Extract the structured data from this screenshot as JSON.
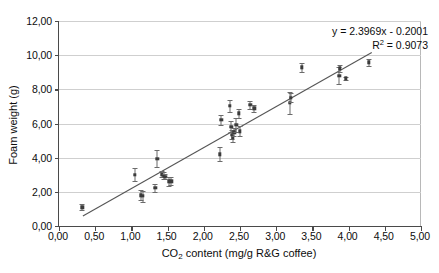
{
  "chart_data": {
    "type": "scatter",
    "title": "",
    "xlabel": "CO2 content (mg/g R&G coffee)",
    "xlabel_main": "CO",
    "xlabel_sub": "2",
    "xlabel_rest": " content (mg/g R&G coffee)",
    "ylabel": "Foam weight (g)",
    "xlim": [
      0,
      5
    ],
    "ylim": [
      0,
      12
    ],
    "x_ticks": [
      "0,00",
      "0,50",
      "1,00",
      "1,50",
      "2,00",
      "2,50",
      "3,00",
      "3,50",
      "4,00",
      "4,50",
      "5,00"
    ],
    "x_tick_values": [
      0,
      0.5,
      1.0,
      1.5,
      2.0,
      2.5,
      3.0,
      3.5,
      4.0,
      4.5,
      5.0
    ],
    "y_ticks": [
      "0,00",
      "2,00",
      "4,00",
      "6,00",
      "8,00",
      "10,00",
      "12,00"
    ],
    "y_tick_values": [
      0,
      2,
      4,
      6,
      8,
      10,
      12
    ],
    "grid": "horizontal",
    "legend": "none",
    "marker": "square",
    "marker_color": "#3b3b3b",
    "errorbar_color": "#6b6b6b",
    "line_color": "#555555",
    "grid_color": "#cfcfcf",
    "axis_color": "#4a4a4a",
    "annotations": {
      "equation": "y = 2.3969x - 0.2001",
      "r_squared_prefix": "R",
      "r_squared_sup": "2",
      "r_squared_value": " = 0.9073",
      "r_squared_full": "R2 = 0.9073"
    },
    "trendline": {
      "slope": 2.3969,
      "intercept": -0.2001,
      "x_start": 0.33,
      "x_end": 4.32
    },
    "points": [
      {
        "x": 0.32,
        "y": 1.1,
        "yerr": 0.18
      },
      {
        "x": 1.05,
        "y": 3.0,
        "yerr": 0.38
      },
      {
        "x": 1.13,
        "y": 1.8,
        "yerr": 0.3
      },
      {
        "x": 1.16,
        "y": 1.75,
        "yerr": 0.32
      },
      {
        "x": 1.33,
        "y": 2.22,
        "yerr": 0.25
      },
      {
        "x": 1.36,
        "y": 3.95,
        "yerr": 0.52
      },
      {
        "x": 1.42,
        "y": 3.02,
        "yerr": 0.18
      },
      {
        "x": 1.45,
        "y": 2.95,
        "yerr": 0.22
      },
      {
        "x": 1.47,
        "y": 2.88,
        "yerr": 0.15
      },
      {
        "x": 1.52,
        "y": 2.62,
        "yerr": 0.25
      },
      {
        "x": 1.55,
        "y": 2.62,
        "yerr": 0.22
      },
      {
        "x": 2.22,
        "y": 4.2,
        "yerr": 0.42
      },
      {
        "x": 2.24,
        "y": 6.22,
        "yerr": 0.28
      },
      {
        "x": 2.36,
        "y": 7.05,
        "yerr": 0.35
      },
      {
        "x": 2.38,
        "y": 5.82,
        "yerr": 0.3
      },
      {
        "x": 2.39,
        "y": 5.35,
        "yerr": 0.25
      },
      {
        "x": 2.4,
        "y": 5.2,
        "yerr": 0.28
      },
      {
        "x": 2.42,
        "y": 5.48,
        "yerr": 0.24
      },
      {
        "x": 2.45,
        "y": 5.92,
        "yerr": 0.42
      },
      {
        "x": 2.48,
        "y": 6.6,
        "yerr": 0.25
      },
      {
        "x": 2.5,
        "y": 5.55,
        "yerr": 0.3
      },
      {
        "x": 2.64,
        "y": 7.08,
        "yerr": 0.22
      },
      {
        "x": 2.7,
        "y": 6.9,
        "yerr": 0.2
      },
      {
        "x": 3.19,
        "y": 7.2,
        "yerr": 0.62
      },
      {
        "x": 3.2,
        "y": 7.52,
        "yerr": 0.25
      },
      {
        "x": 3.35,
        "y": 9.28,
        "yerr": 0.28
      },
      {
        "x": 3.87,
        "y": 8.8,
        "yerr": 0.48
      },
      {
        "x": 3.88,
        "y": 9.22,
        "yerr": 0.22
      },
      {
        "x": 3.96,
        "y": 8.65,
        "yerr": 0.1
      },
      {
        "x": 4.28,
        "y": 9.58,
        "yerr": 0.22
      }
    ]
  }
}
